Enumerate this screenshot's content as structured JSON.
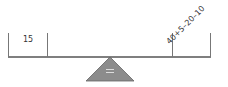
{
  "diagram": {
    "type": "balance-scale",
    "left_pan": {
      "label": "15"
    },
    "right_pan": {
      "label": "40+5–20–10"
    },
    "fulcrum": {
      "symbol": "="
    },
    "colors": {
      "beam": "#555555",
      "pan_walls": "#666666",
      "fulcrum_fill": "#8c8c8c",
      "fulcrum_stroke": "#555555",
      "text": "#333333"
    }
  }
}
